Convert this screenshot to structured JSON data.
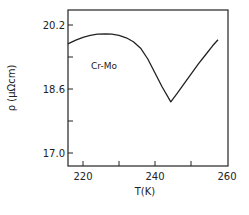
{
  "chart_data": {
    "type": "line",
    "title": "",
    "xlabel": "T(K)",
    "ylabel": "ρ (μΩcm)",
    "xlim": [
      215.5,
      260
    ],
    "ylim": [
      16.6,
      20.8
    ],
    "x_ticks": [
      220,
      230,
      240,
      250,
      260
    ],
    "x_tick_labels": [
      "220",
      "",
      "240",
      "",
      "260"
    ],
    "y_ticks": [
      17.0,
      17.8,
      18.6,
      19.4,
      20.2
    ],
    "y_tick_labels": [
      "17.0",
      "",
      "18.6",
      "",
      "20.2"
    ],
    "grid": false,
    "legend": null,
    "annotations": [
      {
        "text": "Cr-Mo",
        "x": 223,
        "y": 19.2
      }
    ],
    "series": [
      {
        "name": "Cr-Mo",
        "x": [
          215.8,
          218,
          220,
          222,
          224,
          226.4,
          228,
          230,
          232,
          234,
          236,
          238,
          240,
          242,
          244.4,
          246,
          248,
          250,
          252,
          254,
          256,
          257.5
        ],
        "values": [
          19.73,
          19.82,
          19.89,
          19.94,
          19.97,
          19.98,
          19.97,
          19.94,
          19.88,
          19.78,
          19.62,
          19.35,
          19.0,
          18.65,
          18.28,
          18.47,
          18.72,
          18.97,
          19.22,
          19.45,
          19.68,
          19.83
        ]
      }
    ]
  }
}
